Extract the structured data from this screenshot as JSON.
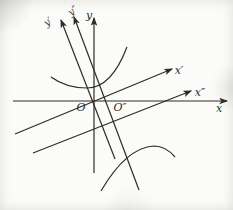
{
  "figure": {
    "colors": {
      "stroke": "#2e2c2a",
      "background": "#fbfbf9"
    },
    "labels": {
      "x_axis": "x",
      "y_axis": "y",
      "x_prime_axis": "x′",
      "x_double_prime_axis": "x″",
      "y_prime_axis": "y′",
      "y_double_prime_axis": "y″",
      "origin": "O",
      "origin_double_prime": "O″"
    },
    "lines": [
      {
        "name": "x-axis-line",
        "x1": 13,
        "y1": 101,
        "x2": 227,
        "y2": 101,
        "arrow": true
      },
      {
        "name": "y-axis-line",
        "x1": 94,
        "y1": 173,
        "x2": 94,
        "y2": 18,
        "arrow": true
      },
      {
        "name": "x-prime-axis-line",
        "x1": 15,
        "y1": 134,
        "x2": 172,
        "y2": 69,
        "arrow": true
      },
      {
        "name": "x-double-prime-axis-line",
        "x1": 33,
        "y1": 153,
        "x2": 191,
        "y2": 91,
        "arrow": true
      },
      {
        "name": "y-prime-axis-line",
        "x1": 115,
        "y1": 159,
        "x2": 61,
        "y2": 20,
        "arrow": true
      },
      {
        "name": "y-double-prime-axis-line",
        "x1": 139,
        "y1": 190,
        "x2": 74,
        "y2": 17,
        "arrow": true
      }
    ],
    "curves": [
      {
        "name": "upper-hyperbola-branch",
        "path": "M 51,77 C 62,85 74,88 87,88 C 106,88 119,68 127,47"
      },
      {
        "name": "lower-hyperbola-branch",
        "path": "M 101,191 C 119,160 137,147 154,146 C 163,146 170,151 175,157"
      }
    ]
  }
}
